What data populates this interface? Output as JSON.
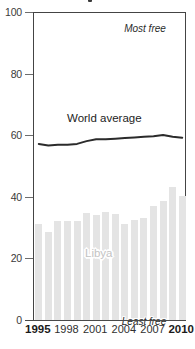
{
  "chart_data": {
    "type": "bar",
    "title": "",
    "xlabel": "",
    "ylabel": "",
    "ylim": [
      0,
      100
    ],
    "yticks": [
      0,
      20,
      40,
      60,
      80,
      100
    ],
    "ytick_labels": [
      "0",
      "20",
      "40",
      "60",
      "80",
      "100"
    ],
    "grid": false,
    "legend_position": "inline-annotations",
    "x": [
      1995,
      1996,
      1997,
      1998,
      1999,
      2000,
      2001,
      2002,
      2003,
      2004,
      2005,
      2006,
      2007,
      2008,
      2009,
      2010
    ],
    "categories": [
      "1995",
      "1996",
      "1997",
      "1998",
      "1999",
      "2000",
      "2001",
      "2002",
      "2003",
      "2004",
      "2005",
      "2006",
      "2007",
      "2008",
      "2009",
      "2010"
    ],
    "xtick_labels": [
      "1995",
      "1998",
      "2001",
      "2004",
      "2007",
      "2010"
    ],
    "xtick_values": [
      1995,
      1998,
      2001,
      2004,
      2007,
      2010
    ],
    "xtick_bold": [
      "1995",
      "2010"
    ],
    "series": [
      {
        "name": "Libya",
        "type": "bar",
        "color": "#e4e4e4",
        "label": "Libya",
        "label_color": "#c3c3c3",
        "values": [
          31.2,
          28.6,
          32.0,
          32.0,
          32.2,
          34.6,
          34.0,
          35.2,
          34.4,
          31.2,
          32.6,
          33.0,
          37.0,
          38.8,
          43.2,
          40.2
        ]
      },
      {
        "name": "World average",
        "type": "line",
        "color": "#2b2b2b",
        "label": "World average",
        "values": [
          57.5,
          57.0,
          57.2,
          57.2,
          57.5,
          58.4,
          59.0,
          59.0,
          59.2,
          59.4,
          59.6,
          59.8,
          60.0,
          60.4,
          59.8,
          59.5
        ]
      }
    ],
    "annotations": [
      {
        "text": "Most free",
        "position": "top-inside",
        "style": "italic"
      },
      {
        "text": "Least free",
        "position": "bottom-inside",
        "style": "italic"
      }
    ]
  },
  "axis": {
    "y_labels": [
      "100",
      "80",
      "60",
      "40",
      "20",
      "0"
    ],
    "x_labels": [
      {
        "text": "1995",
        "bold": true
      },
      {
        "text": "1998",
        "bold": false
      },
      {
        "text": "2001",
        "bold": false
      },
      {
        "text": "2004",
        "bold": false
      },
      {
        "text": "2007",
        "bold": false
      },
      {
        "text": "2010",
        "bold": true
      }
    ]
  },
  "labels": {
    "world_average": "World average",
    "bar_series": "Libya",
    "most_free": "Most free",
    "least_free": "Least free"
  },
  "colors": {
    "bar": "#e4e4e4",
    "line": "#2b2b2b",
    "bar_label": "#c3c3c3",
    "axis": "#444444",
    "text": "#2b2b2b"
  }
}
